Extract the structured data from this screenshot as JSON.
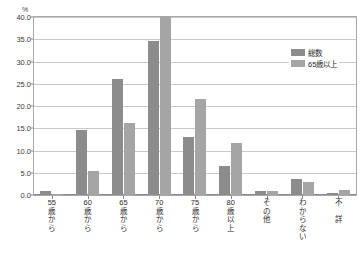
{
  "chart_data": {
    "type": "bar",
    "title": "",
    "xlabel": "",
    "ylabel": "%",
    "ylim": [
      0.0,
      40.0
    ],
    "ytick_step": 5.0,
    "yticks": [
      "0.0",
      "5.0",
      "10.0",
      "15.0",
      "20.0",
      "25.0",
      "30.0",
      "35.0",
      "40.0"
    ],
    "ytick_values": [
      0.0,
      5.0,
      10.0,
      15.0,
      20.0,
      25.0,
      30.0,
      35.0,
      40.0
    ],
    "grid": true,
    "legend_position": "top-right",
    "categories": [
      "55\n歳\nか\nら",
      "60\n歳\nか\nら",
      "65\n歳\nか\nら",
      "70\n歳\nか\nら",
      "75\n歳\nか\nら",
      "80\n歳\n以\n上",
      "そ\nの\n他",
      "わ\nか\nら\nな\nい",
      "不\n\n詳"
    ],
    "categories_plain": [
      "55歳から",
      "60歳から",
      "65歳から",
      "70歳から",
      "75歳から",
      "80歳以上",
      "その他",
      "わからない",
      "不詳"
    ],
    "series": [
      {
        "name": "総数",
        "color": "#8c8c8c",
        "values": [
          0.8,
          14.6,
          26.1,
          34.7,
          13.0,
          6.5,
          1.0,
          3.5,
          0.5
        ]
      },
      {
        "name": "65歳以上",
        "color": "#a5a5a5",
        "values": [
          0.3,
          5.5,
          16.1,
          40.3,
          21.6,
          11.7,
          0.9,
          3.0,
          1.2
        ]
      }
    ]
  },
  "axis": {
    "unit_label": "%"
  },
  "colors": {
    "series_total": "#8c8c8c",
    "series_65plus": "#a5a5a5",
    "frame": "#a8a8a8",
    "grid": "#c9c9c9",
    "text": "#2e2e2e"
  }
}
